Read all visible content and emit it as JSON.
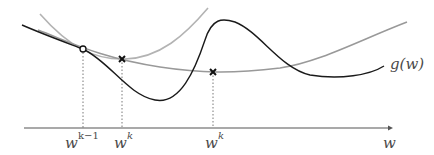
{
  "diagram": {
    "title": "",
    "axis_label": "w",
    "function_label": "g(w)",
    "tick_labels": [
      {
        "base": "w",
        "sup": "k−1",
        "x": 71
      },
      {
        "base": "w",
        "sup": "k",
        "x": 122
      },
      {
        "base": "w",
        "sup": "k",
        "x": 213
      }
    ],
    "colors": {
      "g_curve": "#1a1a1a",
      "quadratic_narrow": "#aaaaaa",
      "quadratic_wide": "#999999",
      "axis": "#555555"
    },
    "markers": [
      {
        "type": "circle",
        "x": 83,
        "y": 49
      },
      {
        "type": "cross",
        "x": 122,
        "y": 59
      },
      {
        "type": "cross",
        "x": 213,
        "y": 72
      }
    ]
  }
}
